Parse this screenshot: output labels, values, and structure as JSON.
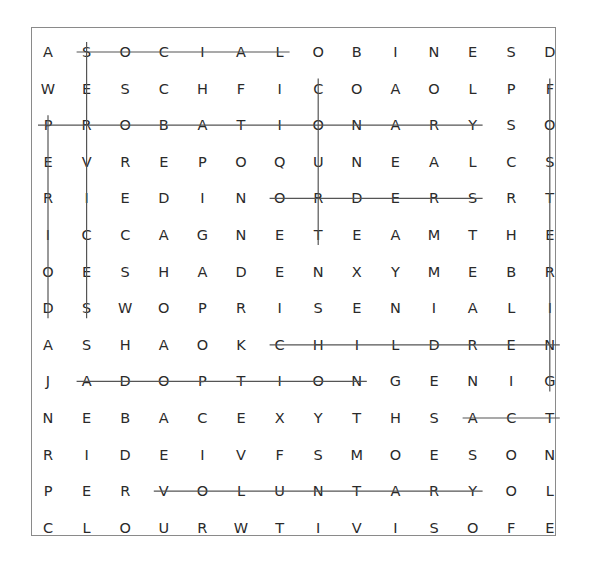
{
  "puzzle": {
    "type": "word-search",
    "rows": 14,
    "cols": 14,
    "grid": [
      [
        "A",
        "S",
        "O",
        "C",
        "I",
        "A",
        "L",
        "O",
        "B",
        "I",
        "N",
        "E",
        "S",
        "D"
      ],
      [
        "W",
        "E",
        "S",
        "C",
        "H",
        "F",
        "I",
        "C",
        "O",
        "A",
        "O",
        "L",
        "P",
        "F"
      ],
      [
        "P",
        "R",
        "O",
        "B",
        "A",
        "T",
        "I",
        "O",
        "N",
        "A",
        "R",
        "Y",
        "S",
        "O"
      ],
      [
        "E",
        "V",
        "R",
        "E",
        "P",
        "O",
        "Q",
        "U",
        "N",
        "E",
        "A",
        "L",
        "C",
        "S"
      ],
      [
        "R",
        "I",
        "E",
        "D",
        "I",
        "N",
        "O",
        "R",
        "D",
        "E",
        "R",
        "S",
        "R",
        "T"
      ],
      [
        "I",
        "C",
        "C",
        "A",
        "G",
        "N",
        "E",
        "T",
        "E",
        "A",
        "M",
        "T",
        "H",
        "E"
      ],
      [
        "O",
        "E",
        "S",
        "H",
        "A",
        "D",
        "E",
        "N",
        "X",
        "Y",
        "M",
        "E",
        "B",
        "R"
      ],
      [
        "D",
        "S",
        "W",
        "O",
        "P",
        "R",
        "I",
        "S",
        "E",
        "N",
        "I",
        "A",
        "L",
        "I"
      ],
      [
        "A",
        "S",
        "H",
        "A",
        "O",
        "K",
        "C",
        "H",
        "I",
        "L",
        "D",
        "R",
        "E",
        "N"
      ],
      [
        "J",
        "A",
        "D",
        "O",
        "P",
        "T",
        "I",
        "O",
        "N",
        "G",
        "E",
        "N",
        "I",
        "G"
      ],
      [
        "N",
        "E",
        "B",
        "A",
        "C",
        "E",
        "X",
        "Y",
        "T",
        "H",
        "S",
        "A",
        "C",
        "T"
      ],
      [
        "R",
        "I",
        "D",
        "E",
        "I",
        "V",
        "F",
        "S",
        "M",
        "O",
        "E",
        "S",
        "O",
        "N"
      ],
      [
        "P",
        "E",
        "R",
        "V",
        "O",
        "L",
        "U",
        "N",
        "T",
        "A",
        "R",
        "Y",
        "O",
        "L"
      ],
      [
        "C",
        "L",
        "O",
        "U",
        "R",
        "W",
        "T",
        "I",
        "V",
        "I",
        "S",
        "O",
        "F",
        "E"
      ]
    ],
    "found_words": [
      {
        "word": "SOCIAL",
        "direction": "horizontal",
        "row": 0,
        "start_col": 1,
        "end_col": 6
      },
      {
        "word": "PROBATIONARY",
        "direction": "horizontal",
        "row": 2,
        "start_col": 0,
        "end_col": 11
      },
      {
        "word": "ORDERS",
        "direction": "horizontal",
        "row": 4,
        "start_col": 6,
        "end_col": 11
      },
      {
        "word": "CHILDREN",
        "direction": "horizontal",
        "row": 8,
        "start_col": 6,
        "end_col": 13
      },
      {
        "word": "ADOPTION",
        "direction": "horizontal",
        "row": 9,
        "start_col": 1,
        "end_col": 8
      },
      {
        "word": "ACT",
        "direction": "horizontal",
        "row": 10,
        "start_col": 11,
        "end_col": 13
      },
      {
        "word": "VOLUNTARY",
        "direction": "horizontal",
        "row": 12,
        "start_col": 3,
        "end_col": 11
      },
      {
        "word": "PERIOD",
        "direction": "vertical",
        "col": 0,
        "start_row": 2,
        "end_row": 7
      },
      {
        "word": "SERVICES",
        "direction": "vertical",
        "col": 1,
        "start_row": 0,
        "end_row": 7
      },
      {
        "word": "COURT",
        "direction": "vertical",
        "col": 7,
        "start_row": 1,
        "end_row": 5
      },
      {
        "word": "FOSTERING",
        "direction": "vertical",
        "col": 13,
        "start_row": 1,
        "end_row": 9
      }
    ]
  },
  "style": {
    "strike_color": "#555555",
    "border_color": "#8a8a8a",
    "text_color": "#2a2a2a"
  }
}
